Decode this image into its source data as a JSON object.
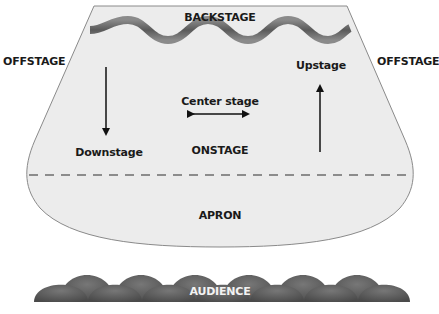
{
  "labels": {
    "backstage": "BACKSTAGE",
    "offstage_left": "OFFSTAGE",
    "offstage_right": "OFFSTAGE",
    "upstage": "Upstage",
    "center_stage": "Center stage",
    "downstage": "Downstage",
    "onstage": "ONSTAGE",
    "apron": "APRON",
    "audience": "AUDIENCE"
  },
  "colors": {
    "stage_fill": "#ececec",
    "stage_outline": "#8a8a8a",
    "curtain": "#6a6a6a",
    "dashed_line": "#8c8c8c",
    "audience_seats": "#5e5e5e",
    "text": "#1a1a1a",
    "audience_text": "#f2f2f2"
  },
  "arrows": [
    {
      "name": "downstage-arrow",
      "direction": "down"
    },
    {
      "name": "center-stage-arrow",
      "direction": "left-right"
    },
    {
      "name": "upstage-arrow",
      "direction": "up"
    }
  ]
}
